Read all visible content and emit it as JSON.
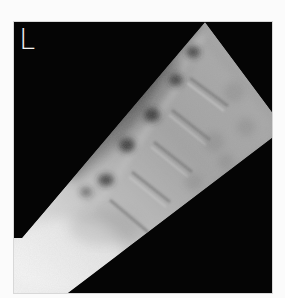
{
  "image": {
    "kind": "lateral-lumbar-spine-radiograph",
    "side_marker": "L",
    "colors": {
      "background": "#050505",
      "page": "#fbfbfb",
      "marker": "#f2f2f2"
    }
  }
}
